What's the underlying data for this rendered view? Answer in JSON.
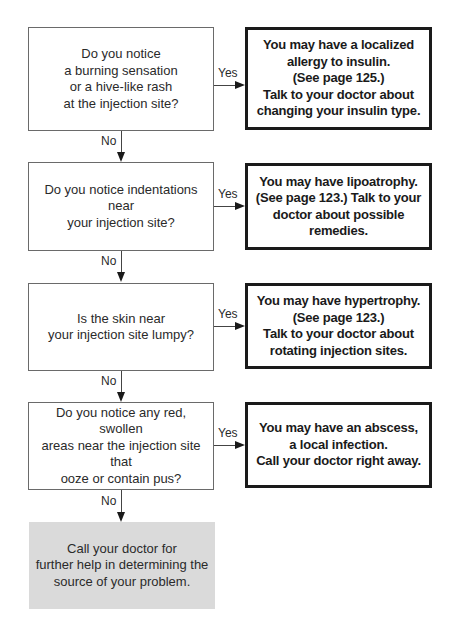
{
  "header": {
    "cutoff_text": ""
  },
  "flowchart": {
    "colors": {
      "question_border": "#6a6a6a",
      "answer_border": "#1a1a1a",
      "final_fill": "#dadada",
      "connector": "#444444"
    },
    "steps": [
      {
        "question": "Do you notice\na burning sensation\nor a hive-like rash\nat the injection site?",
        "yes_label": "Yes",
        "answer": "You may have a localized\nallergy to insulin.\n(See page 125.)\nTalk to your doctor about\nchanging your insulin type.",
        "no_label": "No"
      },
      {
        "question": "Do you notice indentations near\nyour injection site?",
        "yes_label": "Yes",
        "answer": "You may have lipoatrophy.\n(See page 123.) Talk to your\ndoctor about possible remedies.",
        "no_label": "No"
      },
      {
        "question": "Is the skin near\nyour injection site lumpy?",
        "yes_label": "Yes",
        "answer": "You may have hypertrophy.\n(See page 123.)\nTalk to your doctor about\nrotating injection sites.",
        "no_label": "No"
      },
      {
        "question": "Do you notice any red, swollen\nareas near the injection site that\nooze or contain pus?",
        "yes_label": "Yes",
        "answer": "You may have an abscess,\na local infection.\nCall your doctor right away.",
        "no_label": "No"
      }
    ],
    "final": "Call your doctor for\nfurther help in determining the\nsource of your problem."
  }
}
